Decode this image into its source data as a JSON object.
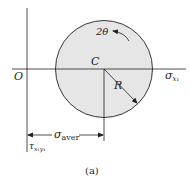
{
  "diagram": {
    "type": "mohr-circle",
    "caption": "(a)",
    "colors": {
      "circle_fill": "#e6e6e7",
      "line": "#231f20",
      "background": "#ffffff"
    },
    "labels": {
      "origin": "O",
      "center": "C",
      "radius": "R",
      "angle": "2θ",
      "horizontal_axis": "σ",
      "horizontal_axis_sub": "x₁",
      "vertical_axis": "τ",
      "vertical_axis_sub": "x₁y₁",
      "distance": "σ",
      "distance_sub": "aver"
    }
  }
}
